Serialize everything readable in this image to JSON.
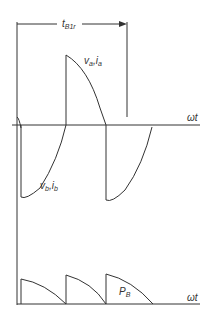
{
  "diagram": {
    "type": "waveform",
    "labels": {
      "interval": "t",
      "interval_sub": "B1r",
      "upper_wave_a": "v",
      "upper_wave_a_sub": "a",
      "upper_wave_a_sep": ",i",
      "upper_wave_a_sub2": "a",
      "lower_wave_b": "v",
      "lower_wave_b_sub": "b",
      "lower_wave_b_sep": ",i",
      "lower_wave_b_sub2": "b",
      "power": "P",
      "power_sub": "B",
      "axis_upper": "ωt",
      "axis_lower": "ωt"
    },
    "colors": {
      "line": "#333333",
      "background": "#ffffff"
    }
  }
}
